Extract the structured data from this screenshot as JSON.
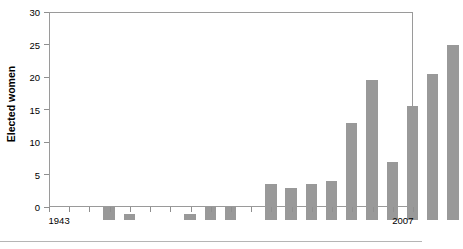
{
  "chart_data": {
    "type": "bar",
    "title": "",
    "xlabel": "",
    "ylabel": "Elected women",
    "ylim": [
      0,
      30
    ],
    "ytick_values": [
      0,
      5,
      10,
      15,
      20,
      25,
      30
    ],
    "ytick_labels": [
      "0",
      "5",
      "10",
      "15",
      "20",
      "25",
      "30"
    ],
    "grid": false,
    "legend": "none",
    "bar_color": "#999999",
    "axis_color": "#8f8f8f",
    "xtick_labels": [
      "1943",
      "1963",
      "1975",
      "1985",
      "1995",
      "2007"
    ],
    "categories": [
      "1943",
      "1948",
      "1951",
      "1954",
      "1957",
      "1961",
      "1965",
      "1969",
      "1973",
      "1977",
      "1981",
      "1982",
      "1987",
      "1989",
      "1992",
      "1997",
      "2002",
      "2007"
    ],
    "values": [
      2,
      1,
      0,
      0,
      1,
      2,
      2,
      0,
      5.5,
      5,
      5.5,
      6,
      15,
      21.5,
      9,
      17.5,
      22.5,
      27
    ]
  },
  "axis": {
    "y_title": "Elected women"
  }
}
